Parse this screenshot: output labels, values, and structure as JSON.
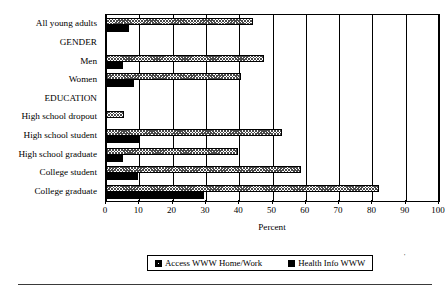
{
  "chart_data": {
    "type": "bar",
    "orientation": "horizontal",
    "title": "",
    "xlabel": "Percent",
    "ylabel": "",
    "xlim": [
      0,
      100
    ],
    "xticks": [
      0,
      10,
      20,
      30,
      40,
      50,
      60,
      70,
      80,
      90,
      100
    ],
    "grid": "vertical",
    "legend_position": "bottom-center",
    "categories": [
      "All young adults",
      "GENDER",
      "Men",
      "Women",
      "EDUCATION",
      "High school dropout",
      "High school student",
      "High school graduate",
      "College student",
      "College graduate"
    ],
    "header_categories": [
      "GENDER",
      "EDUCATION"
    ],
    "series": [
      {
        "name": "Access WWW Home/Work",
        "fill": "hatched",
        "values": [
          44,
          null,
          47.5,
          40.5,
          null,
          5.5,
          53,
          39.5,
          58.5,
          82
        ]
      },
      {
        "name": "Health Info WWW",
        "fill": "solid-black",
        "values": [
          7,
          null,
          5,
          8.5,
          null,
          0,
          10,
          5,
          9.5,
          29.5
        ]
      }
    ]
  },
  "axis": {
    "x_title": "Percent",
    "tick_labels": [
      "0",
      "10",
      "20",
      "30",
      "40",
      "50",
      "60",
      "70",
      "80",
      "90",
      "100"
    ]
  },
  "legend": {
    "entries": [
      {
        "label": "Access WWW Home/Work",
        "swatch": "hatched-square-icon"
      },
      {
        "label": "Health Info WWW",
        "swatch": "filled-square-icon"
      }
    ]
  },
  "marks": {
    "corner_tick": "'"
  },
  "colors": {
    "ink": "#000000",
    "hatch": "#4a4a4a",
    "background": "#ffffff",
    "rule": "#3a3a3a"
  }
}
